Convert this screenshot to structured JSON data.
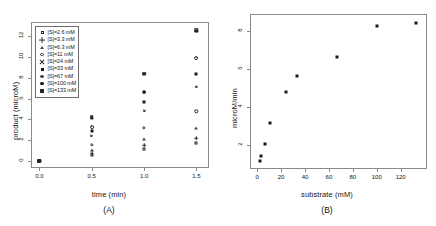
{
  "figure": {
    "panels": [
      {
        "caption": "(A)"
      },
      {
        "caption": "(B)"
      }
    ]
  },
  "chart_data": [
    {
      "type": "scatter",
      "panel": "A",
      "title": "",
      "xlabel": "time (min)",
      "ylabel": "product (microM)",
      "xlim": [
        -0.08,
        1.62
      ],
      "ylim": [
        -0.7,
        13.4
      ],
      "xticks": [
        "0.0",
        "0.5",
        "1.0",
        "1.5"
      ],
      "xtick_values": [
        0.0,
        0.5,
        1.0,
        1.5
      ],
      "yticks": [
        "0",
        "2",
        "4",
        "6",
        "8",
        "10",
        "12"
      ],
      "ytick_values": [
        0,
        2,
        4,
        6,
        8,
        10,
        12
      ],
      "grid": false,
      "legend_position": "top-left",
      "x": [
        0.0,
        0.5,
        1.0,
        1.5
      ],
      "series": [
        {
          "name": "[S]=2.6 mM",
          "symbol": "square-open",
          "values": [
            0,
            0.55,
            1.15,
            1.72
          ]
        },
        {
          "name": "[S]=3.3 mM",
          "symbol": "plus",
          "values": [
            0,
            0.72,
            1.48,
            2.18
          ]
        },
        {
          "name": "[S]=6.3 mM",
          "symbol": "triangle-open",
          "values": [
            0,
            1.05,
            2.12,
            3.18
          ]
        },
        {
          "name": "[S]=11 mM",
          "symbol": "circle-open",
          "values": [
            0,
            1.55,
            3.18,
            4.78
          ]
        },
        {
          "name": "[S]=24 mM",
          "symbol": "cross",
          "values": [
            0,
            2.35,
            4.78,
            7.15
          ]
        },
        {
          "name": "[S]=33 mM",
          "symbol": "square-fill",
          "values": [
            0,
            2.85,
            5.65,
            8.38
          ]
        },
        {
          "name": "[S]=67 mM",
          "symbol": "circle-dot",
          "values": [
            0,
            3.28,
            6.62,
            9.95
          ]
        },
        {
          "name": "[S]=100 mM",
          "symbol": "circle-fill",
          "values": [
            0,
            4.15,
            8.35,
            12.55
          ]
        },
        {
          "name": "[S]=133 mM",
          "symbol": "square-dot",
          "values": [
            0,
            4.22,
            8.42,
            12.62
          ]
        }
      ]
    },
    {
      "type": "scatter",
      "panel": "B",
      "title": "",
      "xlabel": "substrate (mM)",
      "ylabel": "microM/min",
      "xlim": [
        -6,
        142
      ],
      "ylim": [
        0.75,
        8.9
      ],
      "xticks": [
        "0",
        "20",
        "40",
        "60",
        "80",
        "100",
        "120"
      ],
      "xtick_values": [
        0,
        20,
        40,
        60,
        80,
        100,
        120
      ],
      "yticks": [
        "2",
        "4",
        "6",
        "8"
      ],
      "ytick_values": [
        2,
        4,
        6,
        8
      ],
      "grid": false,
      "x": [
        2.6,
        3.3,
        6.3,
        11,
        24,
        33,
        67,
        100,
        133
      ],
      "values": [
        1.15,
        1.45,
        2.05,
        3.15,
        4.78,
        5.65,
        6.62,
        8.28,
        8.42
      ],
      "point_symbol": "square-fill"
    }
  ]
}
